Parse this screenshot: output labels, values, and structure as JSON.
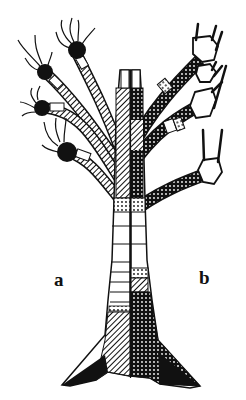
{
  "figure": {
    "labels": {
      "left": "a",
      "right": "b"
    },
    "colors": {
      "ink": "#111111",
      "background": "#ffffff"
    }
  }
}
